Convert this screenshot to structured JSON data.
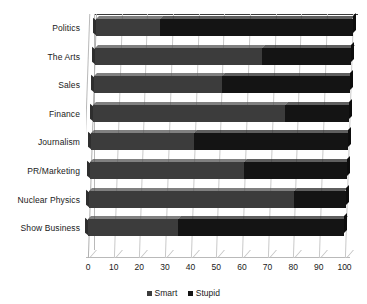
{
  "chart_data": {
    "type": "bar",
    "orientation": "horizontal",
    "stacked": true,
    "title": "",
    "xlabel": "",
    "ylabel": "",
    "xlim": [
      0,
      100
    ],
    "grid": true,
    "legend_position": "bottom",
    "categories": [
      "Politics",
      "The Arts",
      "Sales",
      "Finance",
      "Journalism",
      "PR/Marketing",
      "Nuclear Physics",
      "Show Business"
    ],
    "xticks": [
      0,
      10,
      20,
      30,
      40,
      50,
      60,
      70,
      80,
      90,
      100
    ],
    "series": [
      {
        "name": "Smart",
        "color": "#3c3c3c",
        "values": [
          25,
          65,
          50,
          75,
          40,
          60,
          80,
          35
        ]
      },
      {
        "name": "Stupid",
        "color": "#141414",
        "values": [
          75,
          35,
          50,
          25,
          60,
          40,
          20,
          65
        ]
      }
    ]
  },
  "legend": {
    "items": [
      {
        "label": "Smart",
        "color": "#3c3c3c"
      },
      {
        "label": "Stupid",
        "color": "#141414"
      }
    ]
  }
}
